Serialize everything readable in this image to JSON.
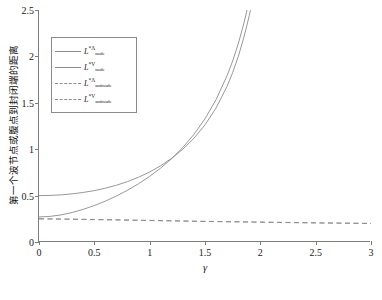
{
  "chart_data": {
    "type": "line",
    "title": "",
    "xlabel": "γ",
    "ylabel": "第一个波节点或腹点到封闭端的距离",
    "xlim": [
      0,
      3
    ],
    "ylim": [
      0,
      2.5
    ],
    "xticks": [
      0,
      0.5,
      1,
      1.5,
      2,
      2.5,
      3
    ],
    "xticklabels": [
      "0",
      "0.5",
      "1",
      "1.5",
      "2",
      "2.5",
      "3"
    ],
    "yticks": [
      0,
      0.5,
      1,
      1.5,
      2,
      2.5
    ],
    "yticklabels": [
      "0",
      "0.5",
      "1",
      "1.5",
      "2",
      "2.5"
    ],
    "grid": false,
    "legend_position": "upper left",
    "asymptote_x": 1.98,
    "series": [
      {
        "name": "L_node_Lambda",
        "label_base": "L",
        "label_sup": "*Λ",
        "label_sub": "node",
        "style": "solid",
        "color": "#8c8c8c",
        "x": [
          0,
          0.1,
          0.2,
          0.3,
          0.4,
          0.5,
          0.6,
          0.7,
          0.8,
          0.9,
          1.0,
          1.1,
          1.2,
          1.3,
          1.4,
          1.5,
          1.6,
          1.7,
          1.75,
          1.8,
          1.85,
          1.88,
          1.9,
          1.92,
          1.94,
          1.95,
          1.96,
          1.965,
          1.97
        ],
        "y": [
          0.5,
          0.502,
          0.508,
          0.519,
          0.534,
          0.554,
          0.58,
          0.612,
          0.651,
          0.698,
          0.754,
          0.822,
          0.903,
          1.0,
          1.118,
          1.262,
          1.444,
          1.68,
          1.825,
          1.995,
          2.2,
          2.34,
          2.44,
          2.55,
          2.68,
          2.76,
          2.85,
          2.9,
          2.96
        ]
      },
      {
        "name": "L_node_V",
        "label_base": "L",
        "label_sup": "*V",
        "label_sub": "node",
        "style": "solid",
        "color": "#8c8c8c",
        "x": [
          0,
          0.1,
          0.2,
          0.3,
          0.4,
          0.5,
          0.6,
          0.7,
          0.8,
          0.9,
          1.0,
          1.1,
          1.2,
          1.3,
          1.4,
          1.5,
          1.6,
          1.7,
          1.75,
          1.8,
          1.85,
          1.88,
          1.9,
          1.92,
          1.94,
          1.95,
          1.96,
          1.97,
          1.975
        ],
        "y": [
          0.27,
          0.276,
          0.292,
          0.318,
          0.352,
          0.393,
          0.441,
          0.496,
          0.558,
          0.628,
          0.707,
          0.797,
          0.9,
          1.019,
          1.16,
          1.328,
          1.534,
          1.794,
          1.951,
          2.133,
          2.35,
          2.5,
          2.6,
          2.72,
          2.85,
          2.93,
          3.02,
          3.12,
          3.18
        ]
      },
      {
        "name": "L_antinode_Lambda",
        "label_base": "L",
        "label_sup": "*Λ",
        "label_sub": "antinode",
        "style": "dashed",
        "color": "#8c8c8c",
        "x": [
          0,
          0.25,
          0.5,
          0.75,
          1.0,
          1.25,
          1.5,
          1.75,
          2.0,
          2.25,
          2.5,
          2.75,
          3.0
        ],
        "y": [
          0.25,
          0.247,
          0.243,
          0.238,
          0.233,
          0.228,
          0.223,
          0.219,
          0.215,
          0.211,
          0.207,
          0.204,
          0.201
        ]
      },
      {
        "name": "L_antinode_V",
        "label_base": "L",
        "label_sup": "*V",
        "label_sub": "antinode",
        "style": "dashed",
        "color": "#8c8c8c",
        "x": [
          0,
          0.25,
          0.5,
          0.75,
          1.0,
          1.25,
          1.5,
          1.75,
          2.0,
          2.25,
          2.5,
          2.75,
          3.0
        ],
        "y": [
          0.25,
          0.246,
          0.241,
          0.236,
          0.231,
          0.226,
          0.221,
          0.217,
          0.213,
          0.209,
          0.205,
          0.202,
          0.199
        ]
      }
    ]
  }
}
